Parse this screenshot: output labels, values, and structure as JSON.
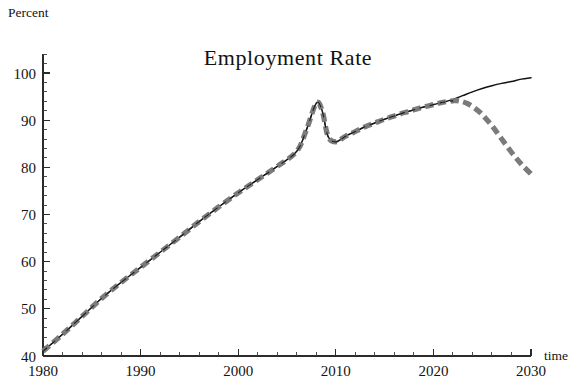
{
  "chart_data": {
    "type": "line",
    "title": "Employment  Rate",
    "xlabel": "time",
    "ylabel": "Percent",
    "xlim": [
      1980,
      2030
    ],
    "ylim": [
      40,
      104
    ],
    "grid": false,
    "legend": "none",
    "x_ticks_major": [
      1980,
      1990,
      2000,
      2010,
      2020,
      2030
    ],
    "x_tick_labels": [
      "1980",
      "1990",
      "2000",
      "2010",
      "2020",
      "2030"
    ],
    "x_ticks_minor_step": 2,
    "y_ticks_major": [
      40,
      50,
      60,
      70,
      80,
      90,
      100
    ],
    "y_tick_labels": [
      "40",
      "50",
      "60",
      "70",
      "80",
      "90",
      "100"
    ],
    "y_ticks_minor_step": 2,
    "series": [
      {
        "name": "trend-solid-black",
        "style": "solid",
        "color": "#111111",
        "width_px": 1.5,
        "x": [
          1980,
          1982,
          1984,
          1986,
          1988,
          1990,
          1992,
          1994,
          1996,
          1998,
          2000,
          2002,
          2004,
          2006,
          2007,
          2008,
          2008.6,
          2009.2,
          2010,
          2011,
          2012,
          2013,
          2014,
          2015,
          2016,
          2017,
          2018,
          2019,
          2020,
          2021,
          2022,
          2023,
          2024,
          2025,
          2026,
          2027,
          2028,
          2029,
          2030
        ],
        "values": [
          41.0,
          44.6,
          48.4,
          52.2,
          55.6,
          58.8,
          62.0,
          65.2,
          68.5,
          71.6,
          74.6,
          77.4,
          80.2,
          83.4,
          88.0,
          93.6,
          92.0,
          86.6,
          85.4,
          86.6,
          87.6,
          88.6,
          89.4,
          90.2,
          90.9,
          91.6,
          92.2,
          92.8,
          93.3,
          93.8,
          94.4,
          95.2,
          96.0,
          96.7,
          97.3,
          97.8,
          98.2,
          98.7,
          99.0
        ]
      },
      {
        "name": "projection-gray-dashed",
        "style": "dashed",
        "color": "#7b7b7b",
        "width_px": 5.2,
        "x": [
          1980,
          1982,
          1984,
          1986,
          1988,
          1990,
          1992,
          1994,
          1996,
          1998,
          2000,
          2002,
          2004,
          2006,
          2007,
          2008,
          2008.6,
          2009.2,
          2010,
          2011,
          2012,
          2013,
          2014,
          2015,
          2016,
          2017,
          2018,
          2019,
          2020,
          2021,
          2022,
          2022.6,
          2023.4,
          2024.2,
          2025,
          2026,
          2027,
          2028,
          2029,
          2030
        ],
        "values": [
          41.0,
          44.6,
          48.4,
          52.2,
          55.6,
          58.8,
          62.0,
          65.2,
          68.5,
          71.6,
          74.6,
          77.4,
          80.2,
          83.4,
          88.0,
          93.6,
          92.0,
          86.6,
          85.4,
          86.6,
          87.6,
          88.6,
          89.4,
          90.2,
          90.9,
          91.6,
          92.2,
          92.8,
          93.3,
          93.8,
          94.1,
          94.1,
          93.6,
          92.6,
          91.2,
          88.8,
          86.0,
          83.2,
          80.7,
          78.6
        ]
      }
    ],
    "annotations": []
  }
}
